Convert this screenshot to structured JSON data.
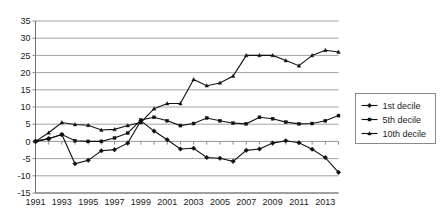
{
  "chart_data": {
    "type": "line",
    "title": "",
    "xlabel": "",
    "ylabel": "",
    "x": [
      1991,
      1992,
      1993,
      1994,
      1995,
      1996,
      1997,
      1998,
      1999,
      2000,
      2001,
      2002,
      2003,
      2004,
      2005,
      2006,
      2007,
      2008,
      2009,
      2010,
      2011,
      2012,
      2013,
      2014
    ],
    "xlim": [
      1991,
      2014
    ],
    "ylim": [
      -15,
      35
    ],
    "y_ticks": [
      -15,
      -10,
      -5,
      0,
      5,
      10,
      15,
      20,
      25,
      30,
      35
    ],
    "x_ticks": [
      1991,
      1993,
      1995,
      1997,
      1999,
      2001,
      2003,
      2005,
      2007,
      2009,
      2011,
      2013
    ],
    "x_tick_labels": [
      "1991",
      "1993",
      "1995",
      "1997",
      "1999",
      "2001",
      "2003",
      "2005",
      "2007",
      "2009",
      "2011",
      "2013"
    ],
    "y_tick_labels": [
      "35",
      "30",
      "25",
      "20",
      "15",
      "10",
      "5",
      "0",
      "-5",
      "-10",
      "-15"
    ],
    "grid": true,
    "legend_position": "right",
    "series": [
      {
        "name": "1st decile",
        "marker": "diamond",
        "color": "#111111",
        "values": [
          0,
          0.8,
          2.0,
          -6.5,
          -5.5,
          -2.7,
          -2.4,
          -0.5,
          6.0,
          3.0,
          0.5,
          -2.2,
          -2.0,
          -4.7,
          -4.9,
          -5.8,
          -2.6,
          -2.2,
          -0.5,
          0.2,
          -0.4,
          -2.3,
          -4.7,
          -9.0
        ]
      },
      {
        "name": "5th decile",
        "marker": "square",
        "color": "#111111",
        "values": [
          0,
          0.8,
          2.0,
          0.2,
          0.0,
          0.0,
          1.0,
          2.4,
          6.2,
          7.0,
          6.0,
          4.6,
          5.2,
          6.8,
          6.0,
          5.3,
          5.1,
          7.0,
          6.6,
          5.6,
          5.1,
          5.2,
          6.0,
          7.5
        ]
      },
      {
        "name": "10th decile",
        "marker": "triangle",
        "color": "#111111",
        "values": [
          0,
          2.5,
          5.5,
          4.9,
          4.7,
          3.3,
          3.5,
          4.6,
          5.5,
          9.5,
          11.0,
          11.0,
          18.0,
          16.2,
          17.0,
          19.0,
          25.0,
          25.0,
          25.0,
          23.5,
          22.0,
          25.0,
          26.5,
          26.0
        ]
      }
    ]
  },
  "legend": {
    "items": [
      {
        "label": "1st decile",
        "marker": "diamond"
      },
      {
        "label": "5th decile",
        "marker": "square"
      },
      {
        "label": "10th decile",
        "marker": "triangle"
      }
    ]
  }
}
